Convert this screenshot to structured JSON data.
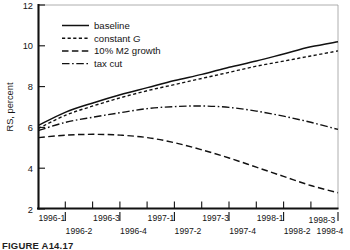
{
  "figure": {
    "caption": "FIGURE A14.17"
  },
  "chart_data": {
    "type": "line",
    "title": "",
    "xlabel": "",
    "ylabel": "RS, percent",
    "ylim": [
      2,
      12
    ],
    "yticks": [
      2,
      4,
      6,
      8,
      10,
      12
    ],
    "ytick_labels": [
      "2",
      "4",
      "6",
      "8",
      "10",
      "12"
    ],
    "grid": false,
    "legend_position": "upper-left-inside",
    "x": [
      "1996-1",
      "1996-2",
      "1996-3",
      "1996-4",
      "1997-1",
      "1997-2",
      "1997-3",
      "1997-4",
      "1998-1",
      "1998-2",
      "1998-3",
      "1998-4"
    ],
    "xtick_labels_top_row": [
      "1996-1",
      "1996-3",
      "1997-1",
      "1997-3",
      "1998-1",
      "1998-3"
    ],
    "xtick_labels_bottom_row": [
      "1996-2",
      "1996-4",
      "1997-2",
      "1997-4",
      "1998-2",
      "1998-4"
    ],
    "series": [
      {
        "name": "baseline",
        "style": "solid",
        "values": [
          6.1,
          6.75,
          7.2,
          7.6,
          7.95,
          8.3,
          8.6,
          8.95,
          9.25,
          9.6,
          9.95,
          10.2
        ]
      },
      {
        "name": "constant G",
        "style": "dashed-short",
        "label_italic_part": "G",
        "values": [
          5.95,
          6.6,
          7.05,
          7.45,
          7.8,
          8.1,
          8.4,
          8.7,
          9.0,
          9.25,
          9.5,
          9.75
        ]
      },
      {
        "name": "10% M2 growth",
        "style": "dashed-long",
        "values": [
          5.5,
          5.62,
          5.66,
          5.62,
          5.5,
          5.25,
          4.9,
          4.5,
          4.05,
          3.6,
          3.15,
          2.8
        ]
      },
      {
        "name": "tax cut",
        "style": "dash-dot",
        "values": [
          5.85,
          6.25,
          6.5,
          6.72,
          6.92,
          7.02,
          7.05,
          6.98,
          6.8,
          6.55,
          6.25,
          5.9
        ]
      }
    ]
  }
}
